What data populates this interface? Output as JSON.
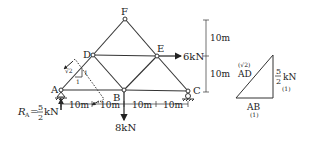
{
  "truss": {
    "nodes": {
      "A": {
        "label": "A",
        "x": 61,
        "y": 90
      },
      "B": {
        "label": "B",
        "x": 124,
        "y": 90
      },
      "C": {
        "label": "C",
        "x": 188,
        "y": 91
      },
      "D": {
        "label": "D",
        "x": 93,
        "y": 55
      },
      "E": {
        "label": "E",
        "x": 157,
        "y": 56
      },
      "F": {
        "label": "F",
        "x": 125,
        "y": 19
      }
    },
    "members": [
      "A-B",
      "B-C",
      "A-D",
      "D-F",
      "F-E",
      "E-C",
      "D-E",
      "D-B",
      "B-E"
    ],
    "loads": {
      "E_horizontal": "6kN",
      "B_vertical": "8kN"
    },
    "reaction": {
      "prefix": "R",
      "subscript": "A",
      "equals": "=",
      "numerator": "5",
      "denominator": "2",
      "unit": "kN"
    },
    "slope_triangle": {
      "hyp": "√2",
      "vertical": "1",
      "horizontal": "1"
    },
    "dimensions": {
      "horizontal": [
        "10m",
        "10m",
        "10m",
        "10m"
      ],
      "vertical": [
        "10m",
        "10m"
      ]
    }
  },
  "force_triangle": {
    "hyp_ratio": "(√2)",
    "hyp_label": "AD",
    "vertical_num": "5",
    "vertical_den": "2",
    "vertical_unit": "kN",
    "vertical_ratio": "(1)",
    "base_label": "AB",
    "base_ratio": "(1)"
  },
  "colors": {
    "line": "#333333",
    "text": "#222222",
    "background": "#ffffff"
  }
}
